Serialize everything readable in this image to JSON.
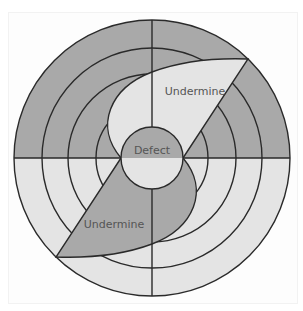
{
  "diagram": {
    "title": "",
    "labels": {
      "defect": "Defect",
      "undermine_upper": "Undermine",
      "undermine_lower": "Undermine"
    },
    "rings": 4,
    "quadrant_divisions": 4,
    "colors": {
      "dark_fill": "#a9a9a9",
      "light_fill": "#e4e4e4",
      "stroke": "#2a2a2a",
      "text": "#555555"
    }
  }
}
